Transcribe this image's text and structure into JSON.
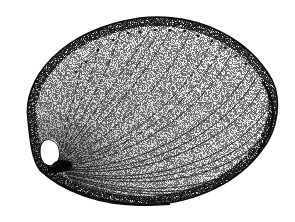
{
  "image": {
    "subject": "abalone shell",
    "style": "stippled pen-and-ink illustration",
    "background": "#ffffff",
    "ink": "#111111"
  },
  "shell": {
    "outline_color": "#0d0d0d",
    "respiratory_holes": 14,
    "growth_lines": 22
  }
}
